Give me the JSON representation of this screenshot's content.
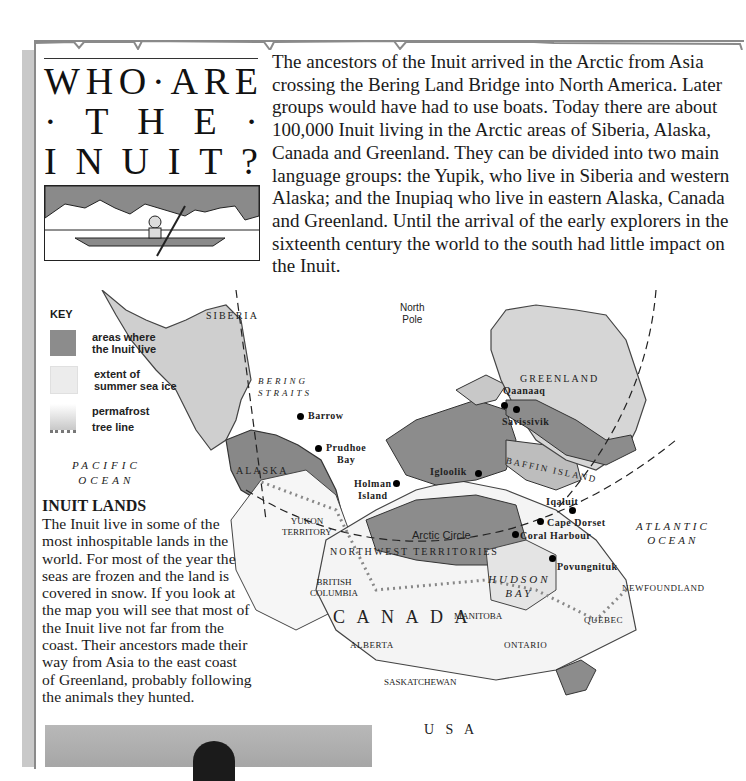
{
  "title": {
    "lines": [
      [
        "W",
        "H",
        "O",
        "·",
        "A",
        "R",
        "E"
      ],
      [
        "·",
        "T",
        "H",
        "E",
        "·"
      ],
      [
        "I",
        "N",
        "U",
        "I",
        "T",
        "?"
      ]
    ],
    "full": "WHO · ARE · THE · INUIT?"
  },
  "illustration": {
    "icon": "kayak-illustration-icon",
    "caption": ""
  },
  "intro": {
    "text": "The ancestors of the Inuit arrived in the Arctic from Asia crossing the Bering Land Bridge into North America. Later groups would have had to use boats. Today there are about 100,000 Inuit living in the Arctic areas of Siberia, Alaska, Canada and Greenland. They can be divided into two main language groups: the Yupik, who live in Siberia and western Alaska; and the Inupiaq who live in eastern Alaska, Canada and Greenland. Until the arrival of the early explorers in the sixteenth century the world to the south had little impact on the Inuit."
  },
  "key": {
    "title": "KEY",
    "items": [
      {
        "label_1": "areas where",
        "label_2": "the Inuit live",
        "icon": "inuit-area-swatch-icon",
        "color": "#8c8c8c"
      },
      {
        "label_1": "extent of",
        "label_2": "summer sea ice",
        "icon": "sea-ice-swatch-icon",
        "color": "#e8e8e8"
      },
      {
        "label_1": "permafrost",
        "label_2": "tree line",
        "icon": "permafrost-tree-line-icon",
        "color": "#9a9a9a"
      }
    ]
  },
  "map": {
    "regions": {
      "siberia": "SIBERIA",
      "bering_1": "BERING",
      "bering_2": "STRAITS",
      "north_pole_1": "North",
      "north_pole_2": "Pole",
      "greenland": "GREENLAND",
      "alaska": "ALASKA",
      "pacific_1": "PACIFIC",
      "pacific_2": "OCEAN",
      "baffin": "BAFFIN ISLAND",
      "arctic_circle": "Arctic Circle",
      "yukon_1": "YUKON",
      "yukon_2": "TERRITORY",
      "nwt": "NORTHWEST TERRITORIES",
      "atlantic_1": "ATLANTIC",
      "atlantic_2": "OCEAN",
      "hudson_1": "HUDSON",
      "hudson_2": "BAY",
      "bc_1": "BRITISH",
      "bc_2": "COLUMBIA",
      "canada": "C A N A D A",
      "manitoba": "MANITOBA",
      "newfoundland": "NEWFOUNDLAND",
      "quebec": "QUEBEC",
      "alberta": "ALBERTA",
      "ontario": "ONTARIO",
      "saskatchewan": "SASKATCHEWAN",
      "usa": "U S A"
    },
    "cities": {
      "barrow": "Barrow",
      "prudhoe_1": "Prudhoe",
      "prudhoe_2": "Bay",
      "qaanaaq": "Qaanaaq",
      "savissivik": "Savissivik",
      "igloolik": "Igloolik",
      "holman_1": "Holman",
      "holman_2": "Island",
      "iqaluit": "Iqaluit",
      "cape_dorset": "Cape Dorset",
      "coral_harbour": "Coral Harbour",
      "povungnituk": "Povungnituk"
    }
  },
  "inuit_lands": {
    "heading": "INUIT LANDS",
    "body": "The Inuit live in some of the most inhospitable lands in the world. For most of the year the seas are frozen and the land is covered in snow. If you look at the map you will see that most of the Inuit live not far from the coast. Their ancestors made their way from Asia to the east coast of Greenland, probably following the animals they hunted."
  },
  "colors": {
    "inuit_area": "#8c8c8c",
    "land": "#d8d8d8",
    "provinces": "#ffffff",
    "border": "#333333"
  }
}
